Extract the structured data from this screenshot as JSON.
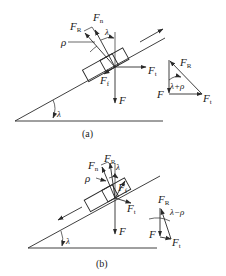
{
  "diagram": {
    "type": "free-body force diagram on inclined plane (screw thread friction)",
    "panels": [
      {
        "id": "a",
        "caption": "(a)",
        "motion_direction": "up the incline",
        "labels": {
          "FR": "F",
          "FR_sub": "R",
          "Fn": "F",
          "Fn_sub": "n",
          "Ff": "F",
          "Ff_sub": "f",
          "Ft": "F",
          "Ft_sub": "t",
          "F": "F",
          "rho": "ρ",
          "lambda": "λ",
          "incline_angle": "λ"
        },
        "triangle": {
          "FR": "F",
          "FR_sub": "R",
          "F": "F",
          "Ft": "F",
          "Ft_sub": "t",
          "angle": "λ+ρ"
        }
      },
      {
        "id": "b",
        "caption": "(b)",
        "motion_direction": "down the incline",
        "labels": {
          "FR": "F",
          "FR_sub": "R",
          "Fn": "F",
          "Fn_sub": "n",
          "Ff": "F",
          "Ff_sub": "f",
          "Ft": "F",
          "Ft_sub": "t",
          "F": "F",
          "rho": "ρ",
          "lambda": "λ",
          "incline_angle": "λ"
        },
        "triangle": {
          "FR": "F",
          "FR_sub": "R",
          "F": "F",
          "Ft": "F",
          "Ft_sub": "t",
          "angle": "λ−ρ"
        }
      }
    ],
    "colors": {
      "ink": "#2a2a2a",
      "background": "#ffffff"
    }
  }
}
